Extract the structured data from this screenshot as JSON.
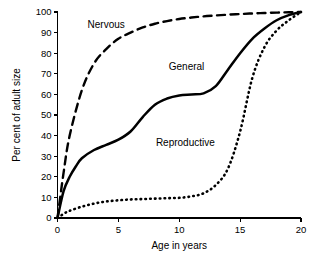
{
  "chart_data": {
    "type": "line",
    "title": "",
    "xlabel": "Age in years",
    "ylabel": "Per cent of adult size",
    "xlim": [
      0,
      20
    ],
    "ylim": [
      0,
      100
    ],
    "xticks": [
      0,
      5,
      10,
      15,
      20
    ],
    "yticks": [
      0,
      10,
      20,
      30,
      40,
      50,
      60,
      70,
      80,
      90,
      100
    ],
    "grid": false,
    "legend_position": "inline-annotations",
    "series": [
      {
        "name": "Nervous",
        "style": "dashed",
        "label_x": 4.0,
        "label_y": 92,
        "x": [
          0,
          0.5,
          1,
          2,
          3,
          4,
          5,
          6,
          7,
          8,
          9,
          10,
          11,
          12,
          13,
          14,
          15,
          16,
          17,
          18,
          19,
          20
        ],
        "y": [
          0,
          22,
          40,
          62,
          75,
          82,
          87,
          90,
          92.5,
          94.3,
          95.6,
          96.6,
          97.3,
          97.9,
          98.3,
          98.7,
          99.0,
          99.3,
          99.5,
          99.7,
          99.9,
          100
        ]
      },
      {
        "name": "General",
        "style": "solid",
        "label_x": 10.6,
        "label_y": 72,
        "x": [
          0,
          0.5,
          1,
          1.5,
          2,
          3,
          4,
          5,
          6,
          7,
          8,
          9,
          10,
          11,
          12,
          13,
          14,
          15,
          16,
          17,
          18,
          19,
          20
        ],
        "y": [
          0,
          13,
          20,
          25,
          29,
          33,
          35.5,
          38,
          42,
          49,
          55,
          58,
          59.5,
          60,
          60.5,
          64,
          72,
          80,
          87,
          92,
          96,
          98.5,
          100
        ]
      },
      {
        "name": "Reproductive",
        "style": "dotted",
        "label_x": 10.5,
        "label_y": 35,
        "x": [
          0,
          0.5,
          1,
          2,
          3,
          4,
          5,
          6,
          7,
          8,
          9,
          10,
          11,
          12,
          13,
          14,
          15,
          16,
          17,
          18,
          19,
          20
        ],
        "y": [
          0,
          2,
          3.5,
          5.5,
          7,
          8,
          8.6,
          9,
          9.2,
          9.4,
          9.6,
          9.8,
          10.5,
          12,
          16,
          24,
          42,
          68,
          83,
          91,
          96,
          100
        ]
      }
    ]
  }
}
